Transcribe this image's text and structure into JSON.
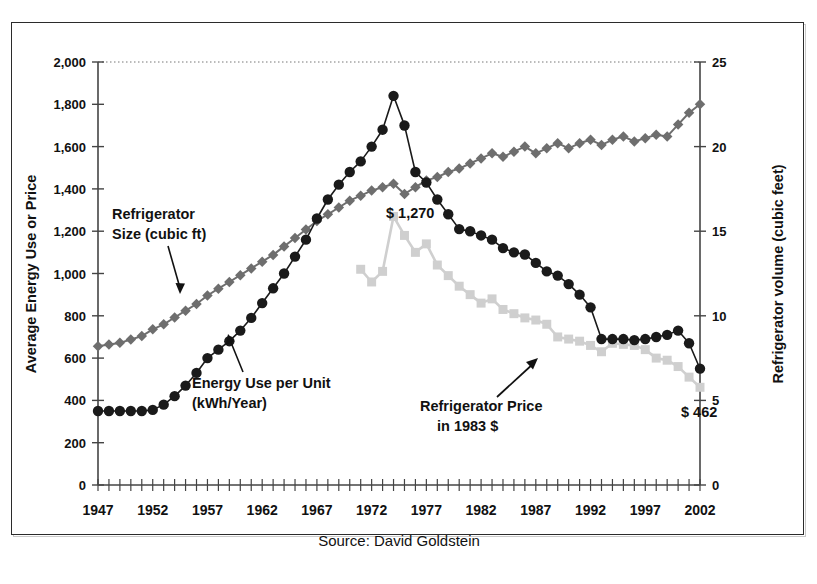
{
  "figure": {
    "source_note": "Source: David Goldstein"
  },
  "axes": {
    "left_title": "Average Energy Use or Price",
    "right_title": "Refrigerator volume (cubic feet)",
    "left_ticks": [
      "0",
      "200",
      "400",
      "600",
      "800",
      "1,000",
      "1,200",
      "1,400",
      "1,600",
      "1,800",
      "2,000"
    ],
    "right_ticks": [
      "0",
      "5",
      "10",
      "15",
      "20",
      "25"
    ],
    "x_ticks": [
      "1947",
      "1952",
      "1957",
      "1962",
      "1967",
      "1972",
      "1977",
      "1982",
      "1987",
      "1992",
      "1997",
      "2002"
    ]
  },
  "annotations": {
    "size_label_line1": "Refrigerator",
    "size_label_line2": "Size (cubic ft)",
    "energy_label_line1": "Energy Use per Unit",
    "energy_label_line2": "(kWh/Year)",
    "price_label_line1": "Refrigerator Price",
    "price_label_line2": "in 1983 $",
    "price_peak_label": "$ 1,270",
    "price_end_label": "$ 462"
  },
  "colors": {
    "energy": "#1a1a1a",
    "size": "#6e6e6e",
    "price": "#cfcfcf",
    "axis": "#444444",
    "frame": "#2b2b2b"
  },
  "chart_data": {
    "type": "line",
    "title": "",
    "subtitle": "",
    "xlabel": "",
    "ylabel": "Average Energy Use or Price",
    "y2label": "Refrigerator volume (cubic feet)",
    "xlim": [
      1947,
      2002
    ],
    "ylim": [
      0,
      2000
    ],
    "y2lim": [
      0,
      25
    ],
    "grid": false,
    "legend": "none (series labelled with arrow annotations)",
    "x": [
      1947,
      1948,
      1949,
      1950,
      1951,
      1952,
      1953,
      1954,
      1955,
      1956,
      1957,
      1958,
      1959,
      1960,
      1961,
      1962,
      1963,
      1964,
      1965,
      1966,
      1967,
      1968,
      1969,
      1970,
      1971,
      1972,
      1973,
      1974,
      1975,
      1976,
      1977,
      1978,
      1979,
      1980,
      1981,
      1982,
      1983,
      1984,
      1985,
      1986,
      1987,
      1988,
      1989,
      1990,
      1991,
      1992,
      1993,
      1994,
      1995,
      1996,
      1997,
      1998,
      1999,
      2000,
      2001,
      2002
    ],
    "series": [
      {
        "name": "Energy Use per Unit (kWh/Year)",
        "axis": "left",
        "unit": "kWh/Year",
        "marker": "circle",
        "color": "#1a1a1a",
        "values": [
          350,
          350,
          350,
          350,
          350,
          355,
          380,
          420,
          470,
          530,
          600,
          640,
          680,
          730,
          790,
          860,
          930,
          1000,
          1080,
          1160,
          1260,
          1350,
          1420,
          1480,
          1530,
          1600,
          1680,
          1840,
          1700,
          1480,
          1430,
          1350,
          1280,
          1210,
          1200,
          1180,
          1160,
          1120,
          1100,
          1090,
          1050,
          1010,
          990,
          950,
          900,
          840,
          690,
          690,
          690,
          685,
          690,
          700,
          710,
          730,
          670,
          550
        ]
      },
      {
        "name": "Refrigerator Size (cubic ft)",
        "axis": "right",
        "unit": "cubic feet",
        "marker": "diamond",
        "color": "#6e6e6e",
        "values": [
          8.2,
          8.3,
          8.4,
          8.6,
          8.8,
          9.2,
          9.5,
          9.9,
          10.3,
          10.7,
          11.2,
          11.6,
          12.0,
          12.4,
          12.8,
          13.2,
          13.6,
          14.1,
          14.6,
          15.1,
          15.6,
          16.0,
          16.4,
          16.8,
          17.1,
          17.4,
          17.6,
          17.8,
          17.2,
          17.6,
          18.0,
          18.2,
          18.5,
          18.7,
          19.0,
          19.3,
          19.6,
          19.4,
          19.7,
          20.0,
          19.6,
          19.9,
          20.2,
          19.9,
          20.2,
          20.4,
          20.1,
          20.4,
          20.6,
          20.3,
          20.5,
          20.7,
          20.6,
          21.3,
          22.0,
          22.5
        ]
      },
      {
        "name": "Refrigerator Price in 1983 $",
        "axis": "left",
        "unit": "1983 dollars",
        "marker": "square",
        "color": "#cfcfcf",
        "start_year": 1971,
        "values": [
          null,
          null,
          null,
          null,
          null,
          null,
          null,
          null,
          null,
          null,
          null,
          null,
          null,
          null,
          null,
          null,
          null,
          null,
          null,
          null,
          null,
          null,
          null,
          null,
          1020,
          960,
          1010,
          1270,
          1180,
          1100,
          1140,
          1040,
          990,
          940,
          900,
          860,
          880,
          830,
          810,
          790,
          780,
          760,
          700,
          690,
          680,
          660,
          630,
          670,
          665,
          660,
          640,
          600,
          590,
          560,
          510,
          462
        ]
      }
    ],
    "annotations": [
      {
        "text": "$ 1,270",
        "series": "Refrigerator Price in 1983 $",
        "x": 1974,
        "y": 1270
      },
      {
        "text": "$ 462",
        "series": "Refrigerator Price in 1983 $",
        "x": 2002,
        "y": 462
      }
    ]
  }
}
